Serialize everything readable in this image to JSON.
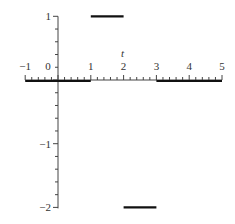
{
  "chart_data": {
    "type": "line",
    "title": "",
    "xlabel": "t",
    "ylabel": "",
    "xlim": [
      -1,
      5
    ],
    "ylim": [
      -2,
      1
    ],
    "grid": false,
    "legend": null,
    "x_ticks": [
      -1,
      0,
      1,
      2,
      3,
      4,
      5
    ],
    "x_tick_labels": [
      "−1",
      "0",
      "1",
      "2",
      "3",
      "4",
      "5"
    ],
    "y_ticks": [
      1,
      -1,
      -2
    ],
    "y_tick_labels": [
      "1",
      "−1",
      "−2"
    ],
    "minor_tick_step": 0.2,
    "series": [
      {
        "name": "piecewise step function",
        "segments": [
          {
            "x": [
              -1,
              1
            ],
            "y": [
              0,
              0
            ]
          },
          {
            "x": [
              1,
              2
            ],
            "y": [
              1,
              1
            ]
          },
          {
            "x": [
              2,
              3
            ],
            "y": [
              -2,
              -2
            ]
          },
          {
            "x": [
              3,
              5
            ],
            "y": [
              0,
              0
            ]
          }
        ],
        "color": "#111111"
      }
    ]
  },
  "colors": {
    "axis": "#444444",
    "line": "#111111",
    "text": "#333333"
  }
}
